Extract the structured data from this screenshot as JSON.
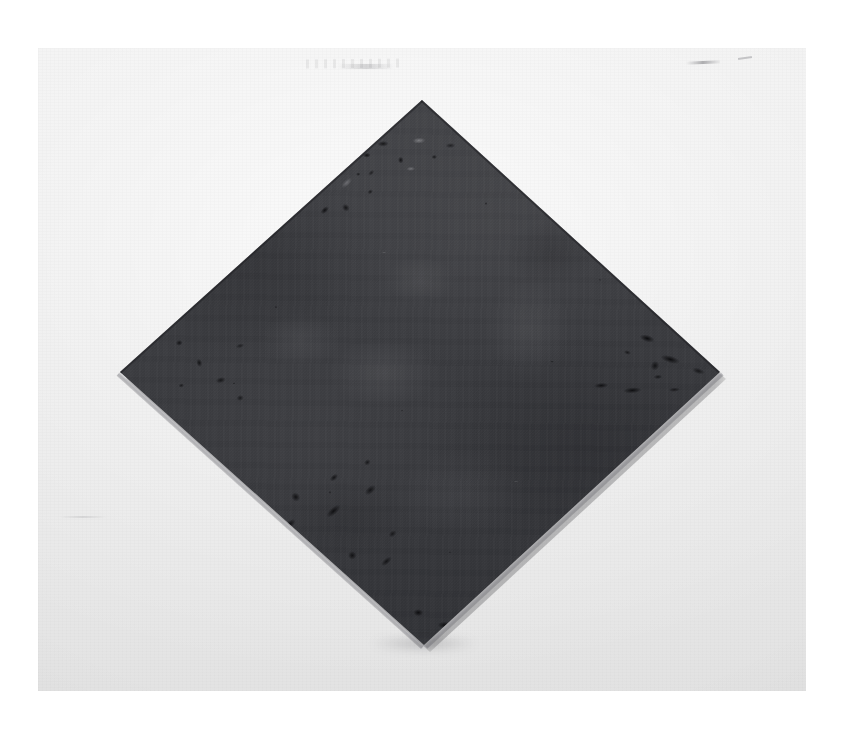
{
  "image": {
    "kind": "photograph-of-artwork",
    "canvas_width": 855,
    "canvas_height": 731,
    "page_background": "#ffffff",
    "print": {
      "left": 38,
      "top": 48,
      "width": 768,
      "height": 643,
      "border_color": "#ffffff"
    },
    "alt_text": "Photograph of a dark charcoal diamond-oriented square panel mounted on a pale gray gallery wall"
  },
  "wall": {
    "name": "gallery-wall",
    "base_color": "#e9e9e9",
    "highlight_color": "#f1f1f1",
    "shadow_color": "#e2e2e2",
    "description": "pale neutral gray wall with soft vertical gradient and faint corner vignette",
    "marks": [
      {
        "id": "top-center-scuff",
        "description": "faint horizontal pencil-like scuff marks above the panel apex"
      },
      {
        "id": "top-right-streak",
        "description": "short dark hairline streak near upper right"
      },
      {
        "id": "left-low-smudge",
        "description": "very faint smudge at lower left"
      }
    ]
  },
  "artwork": {
    "name": "diamond-panel",
    "shape": "square rotated 45 degrees (diamond / lozenge)",
    "surface": "dark charcoal gray, mottled and lightly oxidized",
    "base_color": "#3a3b3f",
    "highlight_color": "#4a4b4f",
    "shadow_color": "#2e2f33",
    "corrosion_color": "#0a0a0c",
    "bevel_color": "#84848a",
    "vertices": {
      "top": {
        "x": 422,
        "y": 100
      },
      "right": {
        "x": 720,
        "y": 372
      },
      "bottom": {
        "x": 424,
        "y": 645
      },
      "left": {
        "x": 120,
        "y": 372
      }
    },
    "width_px": 600,
    "height_px": 545,
    "features": [
      {
        "id": "corrosion-top-left",
        "description": "cluster of chipped/pitted dark and pale flecks along the upper-left edge"
      },
      {
        "id": "corrosion-top-right",
        "description": "scattered dark pits along the upper-right edge"
      },
      {
        "id": "corrosion-right-vertex",
        "description": "heavy dark corrosion streaks converging at the right vertex"
      },
      {
        "id": "corrosion-bottom-left",
        "description": "dense band of dark chipping along the lower-left edge"
      },
      {
        "id": "corrosion-bottom-vertex",
        "description": "dark pitted patches near the bottom vertex"
      },
      {
        "id": "bevel-lower-left",
        "description": "lit side face revealing panel thickness on the lower-left edge"
      },
      {
        "id": "bevel-lower-right",
        "description": "lit side face revealing panel thickness on the lower-right edge"
      },
      {
        "id": "cast-shadow",
        "description": "soft shadow cast on the wall down and to the right"
      }
    ]
  },
  "caption": {
    "text": ""
  }
}
